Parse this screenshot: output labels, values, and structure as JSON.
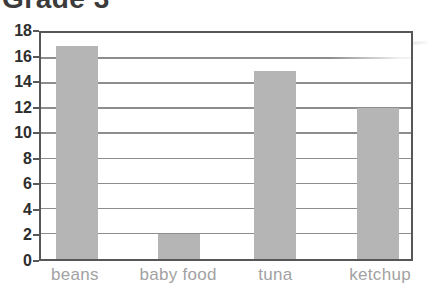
{
  "chart_data": {
    "type": "bar",
    "title": "Grade 3",
    "categories": [
      "beans",
      "baby food",
      "tuna",
      "ketchup"
    ],
    "values": [
      17,
      2,
      15,
      12
    ],
    "xlabel": "",
    "ylabel": "",
    "ylim": [
      0,
      18
    ],
    "yticks": [
      18,
      16,
      14,
      12,
      10,
      8,
      6,
      4,
      2,
      0
    ],
    "grid": true,
    "legend": "none",
    "colors": {
      "bar_fill": "#b5b5b5",
      "grid_line": "#8d8d8d",
      "frame": "#575757",
      "tick_label": "#2e2e2e",
      "category_label": "#a2a2a2",
      "title": "#3b3b3b",
      "background": "#ffffff"
    }
  }
}
